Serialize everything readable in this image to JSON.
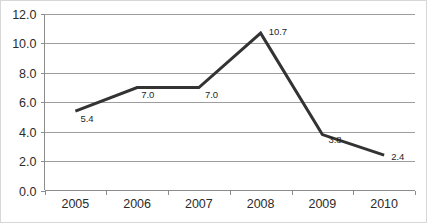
{
  "chart_data": {
    "type": "line",
    "title": "",
    "subtitle": "",
    "xlabel": "",
    "ylabel": "",
    "categories": [
      "2005",
      "2006",
      "2007",
      "2008",
      "2009",
      "2010"
    ],
    "x": [
      2005,
      2006,
      2007,
      2008,
      2009,
      2010
    ],
    "values": [
      5.4,
      7.0,
      7.0,
      10.7,
      3.8,
      2.4
    ],
    "point_labels": [
      "5.4",
      "7.0",
      "7.0",
      "10.7",
      "3.8",
      "2.4"
    ],
    "series": [
      {
        "name": "",
        "values": [
          5.4,
          7.0,
          7.0,
          10.7,
          3.8,
          2.4
        ],
        "color": "#333333"
      }
    ],
    "ylim": [
      0.0,
      12.0
    ],
    "ytick_step": 2.0,
    "ytick_labels": [
      "0.0",
      "2.0",
      "4.0",
      "6.0",
      "8.0",
      "10.0",
      "12.0"
    ],
    "ytick_values": [
      0.0,
      2.0,
      4.0,
      6.0,
      8.0,
      10.0,
      12.0
    ],
    "xtick_labels": [
      "2005",
      "2006",
      "2007",
      "2008",
      "2009",
      "2010"
    ],
    "grid": true,
    "grid_axis": "y",
    "gridline_color": "#9d9d9d",
    "legend": false,
    "legend_position": "none",
    "line_color": "#333333",
    "background_color": "#ffffff",
    "axis_color": "#8c8c8c",
    "label_color": "#2b2b2b",
    "markers": false,
    "annotations": []
  }
}
